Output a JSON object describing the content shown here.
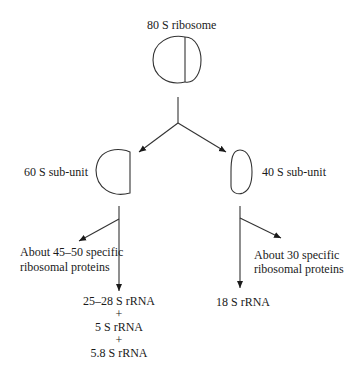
{
  "title": "80 S ribosome",
  "subunits": {
    "large": {
      "label": "60 S sub-unit",
      "proteins": [
        "About 45–50 specific",
        "ribosomal proteins"
      ],
      "rrna": [
        "25–28 S rRNA",
        "+",
        "5 S rRNA",
        "+",
        "5.8 S rRNA"
      ]
    },
    "small": {
      "label": "40 S sub-unit",
      "proteins": [
        "About 30 specific",
        "ribosomal proteins"
      ],
      "rrna": [
        "18 S rRNA"
      ]
    }
  }
}
